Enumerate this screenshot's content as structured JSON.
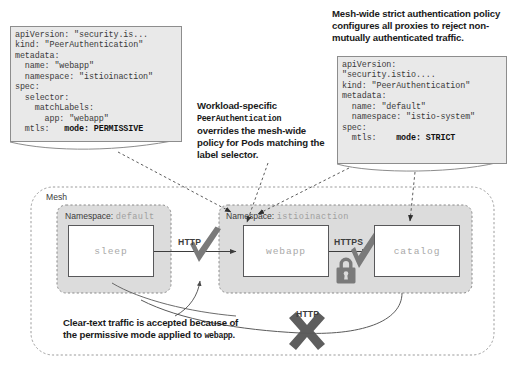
{
  "diagram": {
    "colors": {
      "code_bg": "#e9e9e9",
      "code_border": "#8d8d8d",
      "namespace_fill": "#dcdcdc",
      "mark_gray": "#6e6e6e",
      "box_border": "#58585a",
      "mono_text": "#a9a9a9"
    }
  },
  "code_left": {
    "name": "workload-specific-peerauthentication",
    "lines": "apiVersion: \"security.is...\nkind: \"PeerAuthentication\"\nmetadata:\n  name: \"webapp\"\n  namespace: \"istioinaction\"\nspec:\n  selector:\n    matchLabels:\n      app: \"webapp\"\n  mtls:",
    "highlight": "   mode: PERMISSIVE"
  },
  "code_right": {
    "name": "mesh-wide-peerauthentication",
    "lines": "apiVersion:\n\"security.istio....\nkind: \"PeerAuthentication\"\nmetadata:\n  name: \"default\"\n  namespace: \"istio-system\"\nspec:\n  mtls:",
    "highlight": "    mode: STRICT"
  },
  "captions": {
    "top_right": "Mesh-wide strict authentication policy configures all proxies to reject non-mutually authenticated traffic.",
    "middle_part1": "Workload-specific",
    "middle_mono": "PeerAuthentication",
    "middle_part2": "overrides the mesh-wide policy for Pods matching the label selector.",
    "bottom_part1": "Clear-text traffic is accepted because of the permissive mode applied to",
    "bottom_mono": "webapp",
    "bottom_part3": "."
  },
  "mesh": {
    "label": "Mesh",
    "namespaces": [
      {
        "label": "Namespace:",
        "value": "default"
      },
      {
        "label": "Namespace:",
        "value": "istioinaction"
      }
    ],
    "services": [
      {
        "name": "sleep"
      },
      {
        "name": "webapp"
      },
      {
        "name": "catalog"
      }
    ],
    "connections": [
      {
        "protocol": "HTTP",
        "status": "allowed",
        "marker": "check"
      },
      {
        "protocol": "HTTPS",
        "status": "allowed",
        "marker": "check",
        "secure": true
      },
      {
        "protocol": "HTTP",
        "status": "blocked",
        "marker": "x"
      }
    ]
  }
}
